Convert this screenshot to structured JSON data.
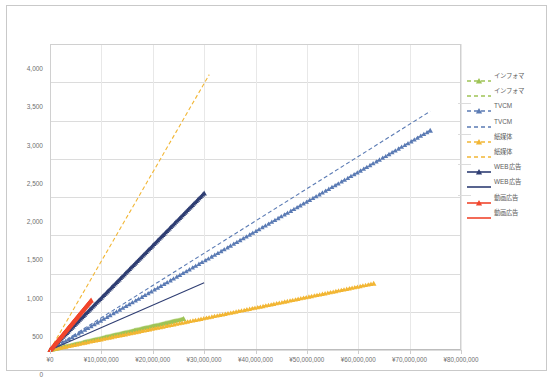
{
  "chart_data": {
    "type": "scatter",
    "title": "",
    "xlabel": "",
    "ylabel": "",
    "xlim": [
      0,
      80000000
    ],
    "ylim": [
      0,
      4000
    ],
    "grid": true,
    "legend_position": "right",
    "x_tick_labels": [
      "¥0",
      "¥10,000,000",
      "¥20,000,000",
      "¥30,000,000",
      "¥40,000,000",
      "¥50,000,000",
      "¥60,000,000",
      "¥70,000,000",
      "¥80,000,000"
    ],
    "x_tick_values": [
      0,
      10000000,
      20000000,
      30000000,
      40000000,
      50000000,
      60000000,
      70000000,
      80000000
    ],
    "y_tick_labels": [
      "0",
      "500",
      "1,000",
      "1,500",
      "2,000",
      "2,500",
      "3,000",
      "3,500",
      "4,000"
    ],
    "y_tick_values": [
      0,
      500,
      1000,
      1500,
      2000,
      2500,
      3000,
      3500,
      4000
    ],
    "series": [
      {
        "name": "インフォマ",
        "variant": "markers",
        "color": "#9ec456",
        "style": "dashed",
        "marker": "triangle",
        "x": [
          0,
          1300000,
          2600000,
          3900000,
          5200000,
          6500000,
          7800000,
          9100000,
          10400000,
          11700000,
          13000000,
          14300000,
          15600000,
          16900000,
          18200000,
          19500000,
          20800000,
          22100000,
          23400000,
          24700000,
          26000000
        ],
        "y": [
          0,
          20,
          40,
          61,
          81,
          101,
          122,
          142,
          163,
          183,
          203,
          224,
          244,
          265,
          285,
          305,
          326,
          346,
          366,
          387,
          407
        ]
      },
      {
        "name": "インフォマ",
        "variant": "trend",
        "color": "#9ec456",
        "style": "dashed",
        "marker": "none",
        "x": [
          0,
          26000000
        ],
        "y": [
          0,
          407
        ]
      },
      {
        "name": "TVCM",
        "variant": "markers",
        "color": "#5b7bb4",
        "style": "dashed",
        "marker": "triangle",
        "x": [
          0,
          3700000,
          7400000,
          11100000,
          14800000,
          18500000,
          22200000,
          25900000,
          29600000,
          33300000,
          37000000,
          40700000,
          44400000,
          48100000,
          51800000,
          55500000,
          59200000,
          62900000,
          66600000,
          70300000,
          74000000
        ],
        "y": [
          0,
          143,
          287,
          430,
          574,
          717,
          861,
          1004,
          1148,
          1291,
          1435,
          1578,
          1722,
          1865,
          2009,
          2152,
          2296,
          2439,
          2583,
          2726,
          2870
        ]
      },
      {
        "name": "TVCM",
        "variant": "trend",
        "color": "#5b7bb4",
        "style": "dashed",
        "marker": "none",
        "x": [
          0,
          74000000
        ],
        "y": [
          0,
          3120
        ]
      },
      {
        "name": "紙媒体",
        "variant": "markers",
        "color": "#f2b634",
        "style": "dashed",
        "marker": "triangle",
        "x": [
          0,
          3150000,
          6300000,
          9450000,
          12600000,
          15750000,
          18900000,
          22050000,
          25200000,
          28350000,
          31500000,
          34650000,
          37800000,
          40950000,
          44100000,
          47250000,
          50400000,
          53550000,
          56700000,
          59850000,
          63000000
        ],
        "y": [
          0,
          43,
          87,
          130,
          174,
          217,
          261,
          304,
          348,
          391,
          435,
          478,
          522,
          565,
          609,
          652,
          696,
          739,
          783,
          826,
          870
        ]
      },
      {
        "name": "紙媒体",
        "variant": "trend",
        "color": "#f2b634",
        "style": "dashed",
        "marker": "none",
        "x": [
          0,
          31000000
        ],
        "y": [
          0,
          3600
        ]
      },
      {
        "name": "WEB広告",
        "variant": "markers",
        "color": "#2f3e73",
        "style": "solid",
        "marker": "triangle",
        "x": [
          0,
          1500000,
          3000000,
          4500000,
          6000000,
          7500000,
          9000000,
          10500000,
          12000000,
          13500000,
          15000000,
          16500000,
          18000000,
          19500000,
          21000000,
          22500000,
          24000000,
          25500000,
          27000000,
          28500000,
          30000000
        ],
        "y": [
          0,
          102,
          205,
          307,
          410,
          512,
          615,
          717,
          820,
          922,
          1025,
          1127,
          1230,
          1332,
          1435,
          1537,
          1640,
          1742,
          1845,
          1947,
          2050
        ]
      },
      {
        "name": "WEB広告",
        "variant": "trend",
        "color": "#2f3e73",
        "style": "solid",
        "marker": "none",
        "x": [
          0,
          30000000
        ],
        "y": [
          0,
          880
        ]
      },
      {
        "name": "動画広告",
        "variant": "markers",
        "color": "#f1462d",
        "style": "solid",
        "marker": "triangle",
        "x": [
          0,
          400000,
          800000,
          1200000,
          1600000,
          2000000,
          2400000,
          2800000,
          3200000,
          3600000,
          4000000,
          4400000,
          4800000,
          5200000,
          5600000,
          6000000,
          6400000,
          6800000,
          7200000,
          7600000,
          8000000
        ],
        "y": [
          0,
          33,
          65,
          98,
          130,
          163,
          195,
          228,
          260,
          293,
          325,
          358,
          390,
          423,
          455,
          488,
          520,
          553,
          585,
          618,
          650
        ]
      },
      {
        "name": "動画広告",
        "variant": "trend",
        "color": "#f1462d",
        "style": "solid",
        "marker": "none",
        "x": [
          0,
          8000000
        ],
        "y": [
          0,
          650
        ]
      }
    ]
  },
  "legend": {
    "entries": [
      {
        "label": "インフォマ",
        "color": "#9ec456",
        "style": "dashed",
        "marker": "triangle"
      },
      {
        "label": "インフォマ",
        "color": "#9ec456",
        "style": "dashed",
        "marker": "none"
      },
      {
        "label": "TVCM",
        "color": "#5b7bb4",
        "style": "dashed",
        "marker": "triangle"
      },
      {
        "label": "TVCM",
        "color": "#5b7bb4",
        "style": "dashed",
        "marker": "none"
      },
      {
        "label": "紙媒体",
        "color": "#f2b634",
        "style": "dashed",
        "marker": "triangle"
      },
      {
        "label": "紙媒体",
        "color": "#f2b634",
        "style": "dashed",
        "marker": "none"
      },
      {
        "label": "WEB広告",
        "color": "#2f3e73",
        "style": "solid",
        "marker": "triangle"
      },
      {
        "label": "WEB広告",
        "color": "#2f3e73",
        "style": "solid",
        "marker": "none"
      },
      {
        "label": "動画広告",
        "color": "#f1462d",
        "style": "solid",
        "marker": "triangle"
      },
      {
        "label": "動画広告",
        "color": "#f1462d",
        "style": "solid",
        "marker": "none"
      }
    ]
  },
  "colors": {
    "axis_text": "#6f6f6f",
    "gridline": "#dcdcdc",
    "plot_border": "#d0d0d0",
    "frame_border": "#c9c9c9",
    "background": "#ffffff"
  }
}
